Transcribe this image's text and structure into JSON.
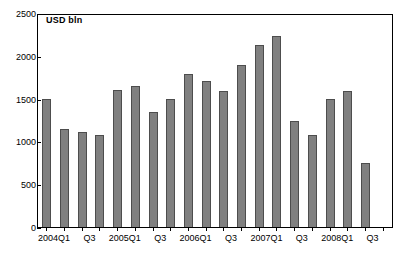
{
  "chart_data": {
    "type": "bar",
    "title": "",
    "axis_unit_label": "USD bln",
    "xlabel": "",
    "ylabel": "",
    "ylim": [
      0,
      2500
    ],
    "ytick_values": [
      0,
      500,
      1000,
      1500,
      2000,
      2500
    ],
    "ytick_labels": [
      "0",
      "500",
      "1000",
      "1500",
      "2000",
      "2500"
    ],
    "grid": false,
    "legend": null,
    "bar_color": "#808080",
    "bar_border_color": "#4d4d4d",
    "categories": [
      "2004Q1",
      "2004Q2",
      "2004Q3",
      "2004Q4",
      "2005Q1",
      "2005Q2",
      "2005Q3",
      "2005Q4",
      "2006Q1",
      "2006Q2",
      "2006Q3",
      "2006Q4",
      "2007Q1",
      "2007Q2",
      "2007Q3",
      "2007Q4",
      "2008Q1",
      "2008Q2",
      "2008Q3",
      "2008Q4"
    ],
    "xtick_labels": [
      "2004Q1",
      "",
      "Q3",
      "",
      "2005Q1",
      "",
      "Q3",
      "",
      "2006Q1",
      "",
      "Q3",
      "",
      "2007Q1",
      "",
      "Q3",
      "",
      "2008Q1",
      "",
      "Q3",
      ""
    ],
    "values": [
      1500,
      1150,
      1110,
      1080,
      1600,
      1650,
      1340,
      1490,
      1790,
      1700,
      1590,
      1890,
      2130,
      2230,
      1240,
      1080,
      1490,
      1590,
      750,
      0
    ]
  }
}
